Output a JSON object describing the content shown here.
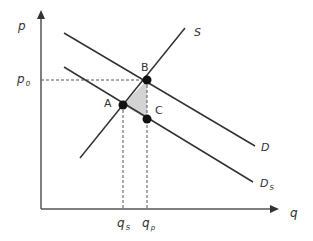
{
  "diagram": {
    "type": "supply-demand",
    "axes": {
      "y_label": "p",
      "x_label": "q"
    },
    "curves": [
      {
        "id": "S",
        "label": "S",
        "kind": "supply"
      },
      {
        "id": "D",
        "label": "D",
        "kind": "demand"
      },
      {
        "id": "Ds",
        "label_main": "D",
        "label_sub": "S",
        "kind": "demand-shifted"
      }
    ],
    "points": [
      {
        "id": "A",
        "label": "A"
      },
      {
        "id": "B",
        "label": "B"
      },
      {
        "id": "C",
        "label": "C"
      }
    ],
    "price_levels": [
      {
        "label_main": "p",
        "label_sub": "0"
      }
    ],
    "quantity_levels": [
      {
        "label_main": "q",
        "label_sub": "S"
      },
      {
        "label_main": "q",
        "label_sub": "p"
      }
    ],
    "shaded_region": {
      "vertices": [
        "A",
        "B",
        "C"
      ],
      "fill": "#d3d3d3"
    },
    "colors": {
      "line": "#333333",
      "dashed": "#555555",
      "point": "#111111",
      "shade": "#d3d3d3"
    }
  }
}
